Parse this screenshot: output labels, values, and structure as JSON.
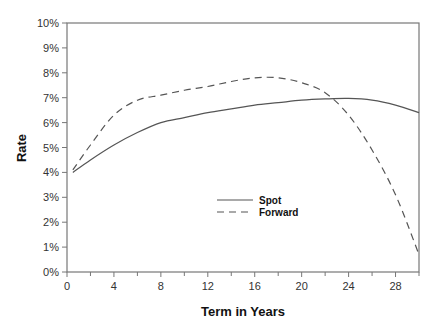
{
  "chart_data": {
    "type": "line",
    "title": "",
    "xlabel": "Term in Years",
    "ylabel": "Rate",
    "xlim": [
      0,
      30
    ],
    "ylim": [
      0,
      10
    ],
    "x_ticks": [
      0,
      4,
      8,
      12,
      16,
      20,
      24,
      28
    ],
    "x_minor_ticks": [
      2,
      6,
      10,
      14,
      18,
      22,
      26,
      30
    ],
    "y_ticks": [
      "0%",
      "1%",
      "2%",
      "3%",
      "4%",
      "5%",
      "6%",
      "7%",
      "8%",
      "9%",
      "10%"
    ],
    "grid": false,
    "legend_position": "center-right (inside plot)",
    "series": [
      {
        "name": "Spot",
        "style": "solid",
        "x": [
          0.5,
          2,
          4,
          6,
          8,
          10,
          12,
          14,
          16,
          18,
          20,
          22,
          24,
          26,
          28,
          30
        ],
        "values": [
          4.0,
          4.5,
          5.1,
          5.6,
          6.0,
          6.2,
          6.4,
          6.55,
          6.7,
          6.8,
          6.9,
          6.95,
          6.97,
          6.9,
          6.7,
          6.4
        ]
      },
      {
        "name": "Forward",
        "style": "dashed",
        "x": [
          0.5,
          2,
          4,
          6,
          8,
          10,
          12,
          14,
          16,
          18,
          20,
          22,
          24,
          26,
          28,
          30
        ],
        "values": [
          4.1,
          5.1,
          6.3,
          6.9,
          7.1,
          7.3,
          7.45,
          7.65,
          7.8,
          7.8,
          7.6,
          7.2,
          6.3,
          4.9,
          3.1,
          0.7
        ]
      }
    ]
  },
  "legend": {
    "spot_label": "Spot",
    "forward_label": "Forward"
  },
  "axes": {
    "x_title": "Term in Years",
    "y_title": "Rate"
  }
}
